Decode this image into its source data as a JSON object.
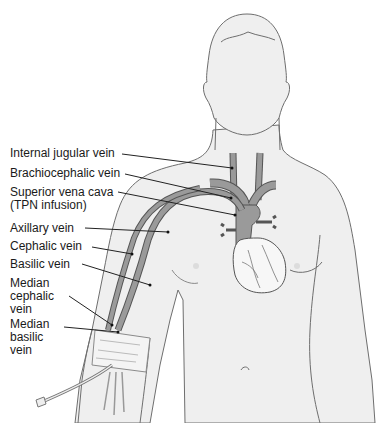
{
  "diagram": {
    "colors": {
      "body_fill": "#efefef",
      "body_outline": "#6e6e6e",
      "vein_fill": "#9a9a9a",
      "vein_outline": "#555555",
      "heart_fill": "#f7f7f7",
      "leader_line": "#222222",
      "label_text": "#1a1a1a"
    },
    "labels": [
      {
        "id": "internal-jugular",
        "text": "Internal jugular vein",
        "x": 10,
        "y": 147
      },
      {
        "id": "brachiocephalic",
        "text": "Brachiocephalic vein",
        "x": 10,
        "y": 167
      },
      {
        "id": "superior-vena-cava",
        "text": "Superior vena cava\n(TPN infusion)",
        "x": 10,
        "y": 186
      },
      {
        "id": "axillary",
        "text": "Axillary vein",
        "x": 10,
        "y": 222
      },
      {
        "id": "cephalic",
        "text": "Cephalic vein",
        "x": 10,
        "y": 240
      },
      {
        "id": "basilic",
        "text": "Basilic vein",
        "x": 10,
        "y": 258
      },
      {
        "id": "median-cephalic",
        "text": "Median\ncephalic\nvein",
        "x": 10,
        "y": 277
      },
      {
        "id": "median-basilic",
        "text": "Median\nbasilic\nvein",
        "x": 10,
        "y": 318
      }
    ]
  }
}
